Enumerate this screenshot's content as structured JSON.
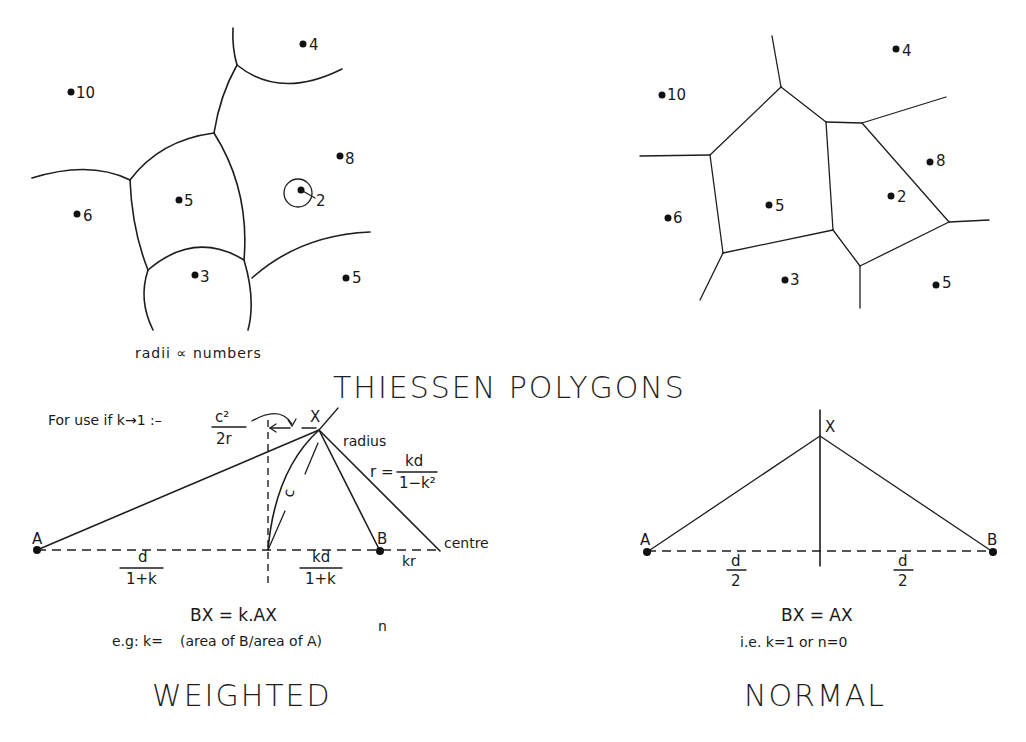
{
  "title": "THIESSEN POLYGONS",
  "top_left_map": {
    "note": "radii ∝ numbers",
    "points": [
      {
        "label": "4",
        "x": 303,
        "y": 44
      },
      {
        "label": "10",
        "x": 71,
        "y": 92
      },
      {
        "label": "8",
        "x": 340,
        "y": 156
      },
      {
        "label": "2",
        "x": 301,
        "y": 190
      },
      {
        "label": "5",
        "x": 179,
        "y": 200
      },
      {
        "label": "6",
        "x": 77,
        "y": 214
      },
      {
        "label": "3",
        "x": 195,
        "y": 275
      },
      {
        "label": "5",
        "x": 346,
        "y": 278
      }
    ]
  },
  "top_right_map": {
    "points": [
      {
        "label": "4",
        "x": 896,
        "y": 49
      },
      {
        "label": "10",
        "x": 662,
        "y": 93
      },
      {
        "label": "8",
        "x": 930,
        "y": 161
      },
      {
        "label": "2",
        "x": 891,
        "y": 196
      },
      {
        "label": "5",
        "x": 769,
        "y": 205
      },
      {
        "label": "6",
        "x": 668,
        "y": 218
      },
      {
        "label": "3",
        "x": 785,
        "y": 280
      },
      {
        "label": "5",
        "x": 936,
        "y": 285
      }
    ]
  },
  "weighted": {
    "heading": "WEIGHTED",
    "note_prefix": "For use if k→1 :–",
    "note_frac_num": "c²",
    "note_frac_den": "2r",
    "point_a": "A",
    "point_b": "B",
    "point_x": "X",
    "arc_label": "c",
    "radius_label": "radius",
    "radius_eq_lhs": "r =",
    "radius_frac_num": "kd",
    "radius_frac_den": "1−k²",
    "centre_label": "centre",
    "kr_label": "kr",
    "left_seg_num": "d",
    "left_seg_den": "1+k",
    "right_seg_num": "kd",
    "right_seg_den": "1+k",
    "equation": "BX = k.AX",
    "example_prefix": "e.g:  k=",
    "example_body": "(area of B/area of A)",
    "example_exp": "n"
  },
  "normal": {
    "heading": "NORMAL",
    "point_a": "A",
    "point_b": "B",
    "point_x": "X",
    "left_seg_num": "d",
    "left_seg_den": "2",
    "right_seg_num": "d",
    "right_seg_den": "2",
    "equation": "BX = AX",
    "note": "i.e.  k=1  or  n=0"
  }
}
